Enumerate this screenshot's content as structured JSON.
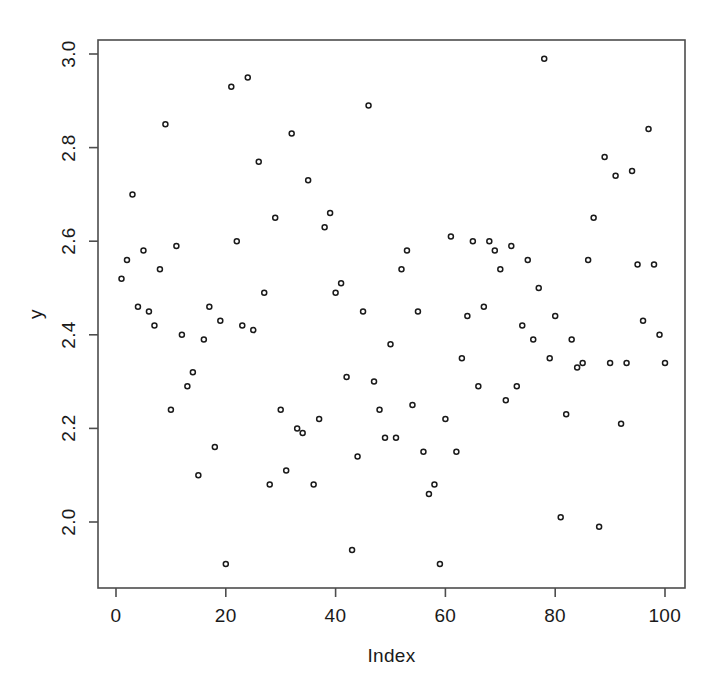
{
  "chart_data": {
    "type": "scatter",
    "title": "",
    "xlabel": "Index",
    "ylabel": "y",
    "xlim": [
      -2.5,
      103
    ],
    "ylim": [
      1.905,
      3.01
    ],
    "xticks": [
      0,
      20,
      40,
      60,
      80,
      100
    ],
    "xtick_labels": [
      "0",
      "20",
      "40",
      "60",
      "80",
      "100"
    ],
    "yticks": [
      2.0,
      2.2,
      2.4,
      2.6,
      2.8,
      3.0
    ],
    "ytick_labels": [
      "2.0",
      "2.2",
      "2.4",
      "2.6",
      "2.8",
      "3.0"
    ],
    "grid": false,
    "legend": null,
    "marker": {
      "shape": "circle-open",
      "size": 5,
      "stroke": "#1a1a1a",
      "fill": "none"
    },
    "frame": {
      "box": true,
      "stroke": "#4d4d4d"
    },
    "n_points": 100,
    "x": [
      1,
      2,
      3,
      4,
      5,
      6,
      7,
      8,
      9,
      10,
      11,
      12,
      13,
      14,
      15,
      16,
      17,
      18,
      19,
      20,
      21,
      22,
      23,
      24,
      25,
      26,
      27,
      28,
      29,
      30,
      31,
      32,
      33,
      34,
      35,
      36,
      37,
      38,
      39,
      40,
      41,
      42,
      43,
      44,
      45,
      46,
      47,
      48,
      49,
      50,
      51,
      52,
      53,
      54,
      55,
      56,
      57,
      58,
      59,
      60,
      61,
      62,
      63,
      64,
      65,
      66,
      67,
      68,
      69,
      70,
      71,
      72,
      73,
      74,
      75,
      76,
      77,
      78,
      79,
      80,
      81,
      82,
      83,
      84,
      85,
      86,
      87,
      88,
      89,
      90,
      91,
      92,
      93,
      94,
      95,
      96,
      97,
      98,
      99,
      100
    ],
    "y": [
      2.52,
      2.56,
      2.7,
      2.46,
      2.58,
      2.45,
      2.42,
      2.54,
      2.85,
      2.24,
      2.59,
      2.4,
      2.29,
      2.32,
      2.1,
      2.39,
      2.46,
      2.16,
      2.43,
      1.91,
      2.93,
      2.6,
      2.42,
      2.95,
      2.41,
      2.77,
      2.49,
      2.08,
      2.65,
      2.24,
      2.11,
      2.83,
      2.2,
      2.19,
      2.73,
      2.08,
      2.22,
      2.63,
      2.66,
      2.49,
      2.51,
      2.31,
      1.94,
      2.14,
      2.45,
      2.89,
      2.3,
      2.24,
      2.18,
      2.38,
      2.18,
      2.54,
      2.58,
      2.25,
      2.45,
      2.15,
      2.06,
      2.08,
      1.91,
      2.22,
      2.61,
      2.15,
      2.35,
      2.44,
      2.6,
      2.29,
      2.46,
      2.6,
      2.58,
      2.54,
      2.26,
      2.59,
      2.29,
      2.42,
      2.56,
      2.39,
      2.5,
      2.99,
      2.35,
      2.44,
      2.01,
      2.23,
      2.39,
      2.33,
      2.34,
      2.56,
      2.65,
      1.99,
      2.78,
      2.34,
      2.74,
      2.21,
      2.34,
      2.75,
      2.55,
      2.43,
      2.84,
      2.55,
      2.4,
      2.34
    ]
  }
}
